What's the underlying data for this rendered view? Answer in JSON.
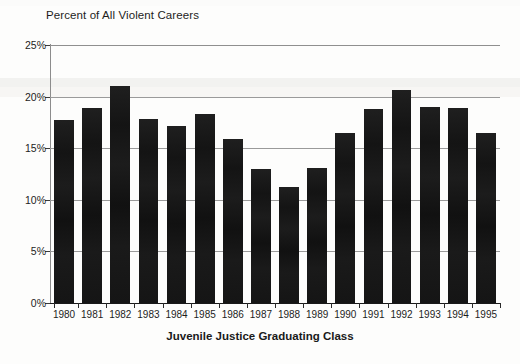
{
  "chart_data": {
    "type": "bar",
    "title": "Percent of All Violent Careers",
    "xlabel": "Juvenile Justice Graduating Class",
    "ylabel": "",
    "categories": [
      "1980",
      "1981",
      "1982",
      "1983",
      "1984",
      "1985",
      "1986",
      "1987",
      "1988",
      "1989",
      "1990",
      "1991",
      "1992",
      "1993",
      "1994",
      "1995"
    ],
    "values": [
      17.7,
      18.9,
      21.0,
      17.8,
      17.2,
      18.3,
      15.9,
      13.0,
      11.2,
      13.1,
      16.5,
      18.8,
      20.6,
      19.0,
      18.9,
      16.5
    ],
    "ylim": [
      0,
      25
    ],
    "yticks": [
      0,
      5,
      10,
      15,
      20,
      25
    ],
    "ytick_labels": [
      "0%",
      "5%",
      "10%",
      "15%",
      "20%",
      "25%"
    ],
    "grid": true,
    "legend": false,
    "bar_color": "#191919",
    "grid_color": "#9a9a9a",
    "axis_color": "#1a1a1a"
  }
}
